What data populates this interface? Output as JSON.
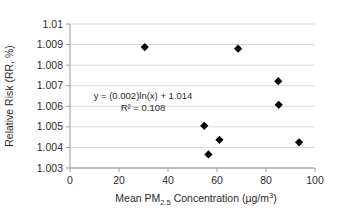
{
  "chart_data": {
    "type": "scatter",
    "title": "",
    "xlabel": "Mean PM2.5 Concentration (µg/m3)",
    "xlabel_parts": {
      "prefix": "Mean PM",
      "subscript": "2.5",
      "middle": " Concentration (µg/m",
      "superscript": "3",
      "suffix": ")"
    },
    "ylabel": "Relative Risk (RR, %)",
    "xlim": [
      0,
      100
    ],
    "ylim": [
      1.003,
      1.01
    ],
    "xticks": [
      "0",
      "20",
      "40",
      "60",
      "80",
      "100"
    ],
    "xtick_values": [
      0,
      20,
      40,
      60,
      80,
      100
    ],
    "yticks": [
      "1.003",
      "1.004",
      "1.005",
      "1.006",
      "1.007",
      "1.008",
      "1.009",
      "1.01"
    ],
    "ytick_values": [
      1.003,
      1.004,
      1.005,
      1.006,
      1.007,
      1.008,
      1.009,
      1.01
    ],
    "grid": true,
    "grid_axis": "y",
    "legend": false,
    "marker": "diamond",
    "marker_color": "#000000",
    "points": [
      {
        "x": 30.5,
        "y": 1.00888
      },
      {
        "x": 68.6,
        "y": 1.0088
      },
      {
        "x": 85.0,
        "y": 1.00722
      },
      {
        "x": 85.2,
        "y": 1.00607
      },
      {
        "x": 54.8,
        "y": 1.00505
      },
      {
        "x": 61.0,
        "y": 1.00437
      },
      {
        "x": 56.5,
        "y": 1.00366
      },
      {
        "x": 93.5,
        "y": 1.00425
      }
    ],
    "trendline": {
      "type": "logarithmic",
      "equation": "y = (0.002)ln(x) + 1.014",
      "r_squared_label": "R² = 0.108",
      "r_squared": 0.108,
      "coefficient": 0.002,
      "intercept": 1.014,
      "color": "#4a4a4a",
      "x_start": 31.0,
      "x_end": 94.0
    },
    "annotations": [
      {
        "text": "y = (0.002)ln(x) + 1.014",
        "x": 0.16,
        "y": 1.00625
      },
      {
        "text": "R² = 0.108",
        "x": 0.3,
        "y": 1.00582
      }
    ]
  },
  "axes": {
    "line_color": "#808080",
    "grid_color": "#d9d9d9"
  }
}
